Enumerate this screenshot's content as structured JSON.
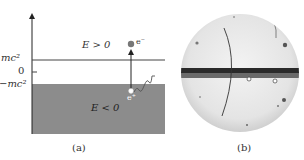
{
  "panel_a": {
    "caption": "(a)",
    "y_labels": {
      "mc2": "mc²",
      "zero": "0",
      "neg_mc2": "−mc²"
    },
    "region_upper_label": "E > 0",
    "region_lower_label": "E < 0",
    "electron_label": "e⁻",
    "positron_label": "e⁺",
    "colors": {
      "sea": "#8c8c8c",
      "line": "#444444",
      "electron": "#777777",
      "hole": "#ffffff"
    }
  },
  "panel_b": {
    "caption": "(b)",
    "description": "cloud chamber photograph with positron track"
  }
}
